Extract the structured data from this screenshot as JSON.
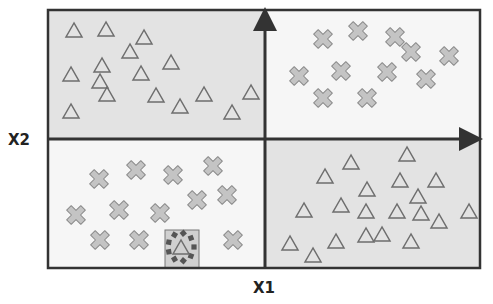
{
  "diagram": {
    "axes": {
      "x_label": "X1",
      "y_label": "X2"
    },
    "frame": {
      "left": 48,
      "top": 10,
      "right": 480,
      "bottom": 268,
      "axis_x": 265,
      "axis_y": 139
    },
    "colors": {
      "shaded_quadrant": "#e3e3e3",
      "light_quadrant": "#f6f6f6",
      "border": "#333333",
      "marker_fill": "#c4c4c4",
      "marker_stroke": "#8a8a8a",
      "triangle_stroke": "#6e6e6e",
      "highlight_box": "#d0d0d0",
      "highlight_dots": "#555555"
    },
    "quadrants": [
      {
        "name": "top-left",
        "shaded": true,
        "class": "triangle",
        "points": [
          [
            74,
            31
          ],
          [
            106,
            30
          ],
          [
            144,
            38
          ],
          [
            130,
            52
          ],
          [
            102,
            66
          ],
          [
            71,
            75
          ],
          [
            100,
            82
          ],
          [
            107,
            95
          ],
          [
            71,
            112
          ],
          [
            141,
            74
          ],
          [
            171,
            63
          ],
          [
            156,
            96
          ],
          [
            180,
            107
          ],
          [
            204,
            95
          ],
          [
            232,
            113
          ],
          [
            251,
            93
          ]
        ]
      },
      {
        "name": "top-right",
        "shaded": false,
        "class": "cross",
        "points": [
          [
            323,
            39
          ],
          [
            358,
            31
          ],
          [
            395,
            37
          ],
          [
            411,
            52
          ],
          [
            449,
            56
          ],
          [
            299,
            76
          ],
          [
            341,
            71
          ],
          [
            387,
            72
          ],
          [
            426,
            79
          ],
          [
            323,
            98
          ],
          [
            367,
            98
          ]
        ]
      },
      {
        "name": "bottom-left",
        "shaded": false,
        "class": "cross",
        "points": [
          [
            99,
            179
          ],
          [
            136,
            170
          ],
          [
            173,
            175
          ],
          [
            213,
            166
          ],
          [
            76,
            215
          ],
          [
            119,
            210
          ],
          [
            197,
            200
          ],
          [
            227,
            195
          ],
          [
            160,
            213
          ],
          [
            100,
            240
          ],
          [
            139,
            240
          ],
          [
            233,
            240
          ]
        ]
      },
      {
        "name": "bottom-right",
        "shaded": true,
        "class": "triangle",
        "points": [
          [
            351,
            163
          ],
          [
            325,
            177
          ],
          [
            367,
            190
          ],
          [
            304,
            211
          ],
          [
            341,
            206
          ],
          [
            366,
            212
          ],
          [
            290,
            244
          ],
          [
            313,
            256
          ],
          [
            336,
            242
          ],
          [
            366,
            236
          ],
          [
            407,
            155
          ],
          [
            400,
            181
          ],
          [
            436,
            181
          ],
          [
            418,
            197
          ],
          [
            397,
            212
          ],
          [
            421,
            214
          ],
          [
            439,
            222
          ],
          [
            469,
            212
          ],
          [
            382,
            235
          ],
          [
            411,
            242
          ]
        ]
      }
    ],
    "highlight": {
      "label": "outlier",
      "class": "triangle",
      "box": [
        165,
        230,
        34,
        38
      ],
      "point": [
        181,
        247
      ]
    }
  }
}
